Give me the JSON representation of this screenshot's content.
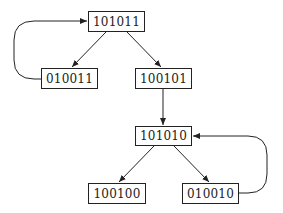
{
  "diagram": {
    "type": "state-transition-graph",
    "nodes": [
      {
        "id": "n1",
        "label": "101011"
      },
      {
        "id": "n2",
        "label": "010011"
      },
      {
        "id": "n3",
        "label": "100101"
      },
      {
        "id": "n4",
        "label": "101010"
      },
      {
        "id": "n5",
        "label": "100100"
      },
      {
        "id": "n6",
        "label": "010010"
      }
    ],
    "edges": [
      {
        "from": "101011",
        "to": "010011"
      },
      {
        "from": "101011",
        "to": "100101"
      },
      {
        "from": "010011",
        "to": "101011"
      },
      {
        "from": "100101",
        "to": "101010"
      },
      {
        "from": "101010",
        "to": "100100"
      },
      {
        "from": "101010",
        "to": "010010"
      },
      {
        "from": "010010",
        "to": "101010"
      }
    ],
    "colors": {
      "stroke": "#222222",
      "background": "#ffffff"
    }
  }
}
